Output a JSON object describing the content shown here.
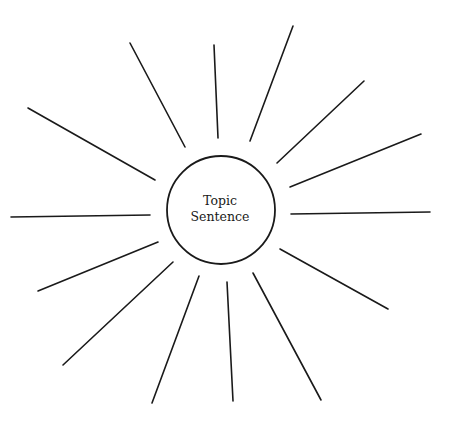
{
  "diagram": {
    "type": "sunburst-web",
    "center": {
      "cx": 221,
      "cy": 210,
      "r": 54
    },
    "label_line1": "Topic",
    "label_line2": "Sentence",
    "colors": {
      "stroke": "#1a1a1a",
      "background": "#ffffff"
    },
    "rays": [
      {
        "x1": 28,
        "y1": 108,
        "x2": 155,
        "y2": 180
      },
      {
        "x1": 130,
        "y1": 43,
        "x2": 185,
        "y2": 147
      },
      {
        "x1": 214,
        "y1": 45,
        "x2": 218,
        "y2": 138
      },
      {
        "x1": 293,
        "y1": 26,
        "x2": 250,
        "y2": 141
      },
      {
        "x1": 364,
        "y1": 81,
        "x2": 277,
        "y2": 163
      },
      {
        "x1": 421,
        "y1": 134,
        "x2": 290,
        "y2": 187
      },
      {
        "x1": 430,
        "y1": 212,
        "x2": 291,
        "y2": 214
      },
      {
        "x1": 388,
        "y1": 309,
        "x2": 280,
        "y2": 249
      },
      {
        "x1": 321,
        "y1": 400,
        "x2": 253,
        "y2": 273
      },
      {
        "x1": 233,
        "y1": 401,
        "x2": 227,
        "y2": 282
      },
      {
        "x1": 152,
        "y1": 403,
        "x2": 199,
        "y2": 276
      },
      {
        "x1": 63,
        "y1": 365,
        "x2": 173,
        "y2": 262
      },
      {
        "x1": 38,
        "y1": 291,
        "x2": 158,
        "y2": 242
      },
      {
        "x1": 11,
        "y1": 217,
        "x2": 150,
        "y2": 215
      }
    ]
  }
}
